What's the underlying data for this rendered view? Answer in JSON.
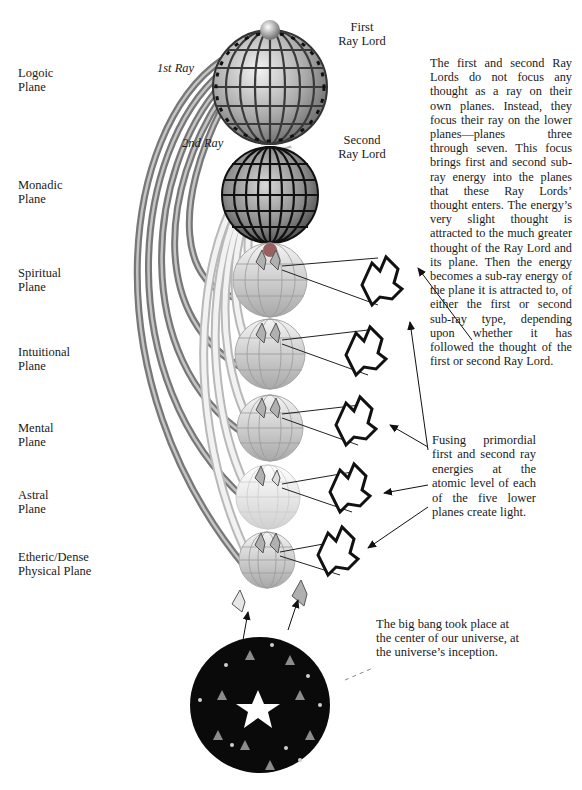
{
  "planes": [
    {
      "label": "Logoic\nPlane",
      "top": 66
    },
    {
      "label": "Monadic\nPlane",
      "top": 178
    },
    {
      "label": "Spiritual\nPlane",
      "top": 266
    },
    {
      "label": "Intuitional\nPlane",
      "top": 345
    },
    {
      "label": "Mental\nPlane",
      "top": 421
    },
    {
      "label": "Astral\nPlane",
      "top": 488
    },
    {
      "label": "Etheric/Dense\nPhysical Plane",
      "top": 550
    }
  ],
  "ray_lords": {
    "first": "First\nRay Lord",
    "second": "Second\nRay Lord"
  },
  "rays": {
    "first": "1st Ray",
    "second": "2nd Ray"
  },
  "fusing_note": "Fusing primordial first and second ray energies at the atomic level of each of the five lower planes create light.",
  "big_bang_note": "The big bang took place at the center of our universe, at the universe’s inception.",
  "colors": {
    "ray1_tube": "#8a8a8a",
    "ray2_tube": "#d8d8d8",
    "globe_dark": "#3a3a3a",
    "universe": "#0a0a0a"
  }
}
